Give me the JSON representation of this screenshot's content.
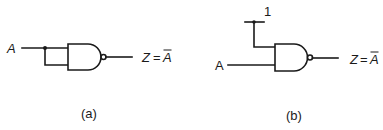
{
  "diagram": {
    "type": "logic-circuit",
    "colors": {
      "stroke": "#1a1a1a",
      "background": "#ffffff"
    },
    "panels": [
      {
        "id": "a",
        "caption": "(a)",
        "gate": "NAND",
        "input_label": "A",
        "output_label": "Z = Ā",
        "output_lhs": "Z",
        "output_eq": "=",
        "output_rhs": "A",
        "description": "NAND gate with both inputs tied together to input A, acting as an inverter"
      },
      {
        "id": "b",
        "caption": "(b)",
        "gate": "NAND",
        "input_label": "A",
        "constant_input_label": "1",
        "output_label": "Z = Ā",
        "output_lhs": "Z",
        "output_eq": "=",
        "output_rhs": "A",
        "description": "NAND gate with one input tied to logic 1 and the other to A, acting as an inverter"
      }
    ]
  }
}
